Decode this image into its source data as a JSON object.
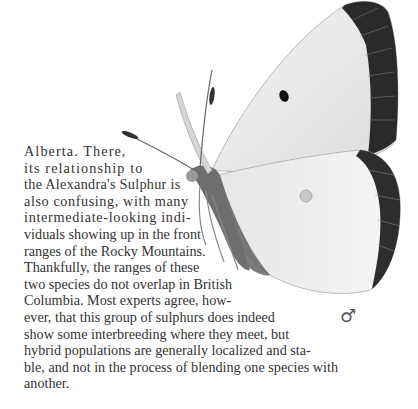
{
  "page": {
    "paragraph_lines": [
      "Alberta. There,",
      "its relationship to",
      "the Alexandra's Sulphur is",
      "also confusing, with many",
      "intermediate-looking indi-",
      "viduals showing up in the front",
      "ranges of the Rocky Mountains.",
      "Thankfully, the ranges of these",
      "two species do not overlap in British",
      "Columbia. Most experts agree, how-",
      "ever, that this group of sulphurs does indeed",
      "show some interbreeding where they meet, but",
      "hybrid populations are generally localized and sta-",
      "ble, and not in the process of blending one species with",
      "another."
    ],
    "illustration": {
      "subject": "butterfly-illustration",
      "sex_symbol": "♂"
    }
  }
}
